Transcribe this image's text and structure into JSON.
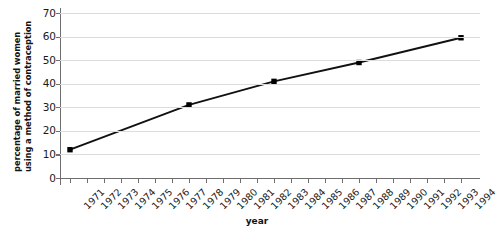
{
  "chart_data": {
    "type": "line",
    "title": "",
    "xlabel": "year",
    "ylabel": "percentage of married women using a method of contraception",
    "ylabel_lines": [
      "percentage of married women",
      "using a method of contraception"
    ],
    "x": [
      1971,
      1978,
      1983,
      1988,
      1994
    ],
    "values": [
      12,
      31,
      41,
      49,
      59.5
    ],
    "series": [
      {
        "name": "percentage of married women using a method of contraception",
        "x": [
          1971,
          1978,
          1983,
          1988,
          1994
        ],
        "values": [
          12,
          31,
          41,
          49,
          59.5
        ]
      }
    ],
    "xlim": [
      1971,
      1994
    ],
    "ylim": [
      0,
      70
    ],
    "yticks": [
      0,
      10,
      20,
      30,
      40,
      50,
      60,
      70
    ],
    "ytick_labels": [
      "0",
      "10",
      "20",
      "30",
      "40",
      "50",
      "60",
      "70"
    ],
    "xticks": [
      1971,
      1972,
      1973,
      1974,
      1975,
      1976,
      1977,
      1978,
      1979,
      1980,
      1981,
      1982,
      1983,
      1984,
      1985,
      1986,
      1987,
      1988,
      1989,
      1990,
      1991,
      1992,
      1993,
      1994
    ],
    "xtick_labels": [
      "1971",
      "1972",
      "1973",
      "1974",
      "1975",
      "1976",
      "1977",
      "1978",
      "1979",
      "1980",
      "1981",
      "1982",
      "1983",
      "1984",
      "1985",
      "1986",
      "1987",
      "1988",
      "1989",
      "1990",
      "1991",
      "1992",
      "1993",
      "1994"
    ],
    "grid": true,
    "grid_axis": "y",
    "grid_color": "#dcdcdc",
    "legend": false,
    "legend_position": "none",
    "line_color": "#111111",
    "marker": "square",
    "marker_color": "#000000",
    "axis_color": "#6e6e6e",
    "background": "#ffffff"
  }
}
